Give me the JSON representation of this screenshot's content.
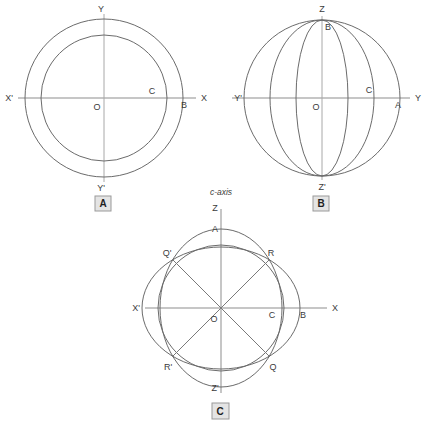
{
  "figure": {
    "background_color": "#ffffff",
    "curve_color": "#6b6b6b",
    "axis_color": "#8d8d8d",
    "label_color": "#3b3b3b",
    "panel_box_fill": "#e4e4e4",
    "panel_box_border": "#9a9a9a"
  },
  "panels": [
    {
      "id": "A",
      "letter": "A",
      "description": "uniaxial-indicatrix-section-two-concentric-circles",
      "labels": {
        "top": "Y",
        "bottom": "Y'",
        "left": "X'",
        "right": "X",
        "center": "O",
        "inner_radius_point": "C",
        "outer_radius_point": "B"
      }
    },
    {
      "id": "B",
      "letter": "B",
      "description": "sphere-with-meridian-ellipses",
      "labels": {
        "top": "Z",
        "bottom": "Z'",
        "left": "Y'",
        "right": "Y",
        "center": "O",
        "inner_vertical_point": "B",
        "inner_horizontal_point": "C",
        "outer_horizontal_point": "A"
      }
    },
    {
      "id": "C",
      "letter": "C",
      "description": "biaxial-indicatrix-two-intersecting-ellipses-with-optic-axes",
      "axis_caption": "c-axis",
      "labels": {
        "top": "Z",
        "bottom": "Z'",
        "left": "X'",
        "right": "X",
        "center": "O",
        "vertical_ellipse_top": "A",
        "horizontal_ellipse_right": "B",
        "inner_circle_right": "C",
        "upper_right_intersection": "R",
        "upper_left_intersection": "Q'",
        "lower_right_intersection": "Q",
        "lower_left_intersection": "R'"
      }
    }
  ]
}
